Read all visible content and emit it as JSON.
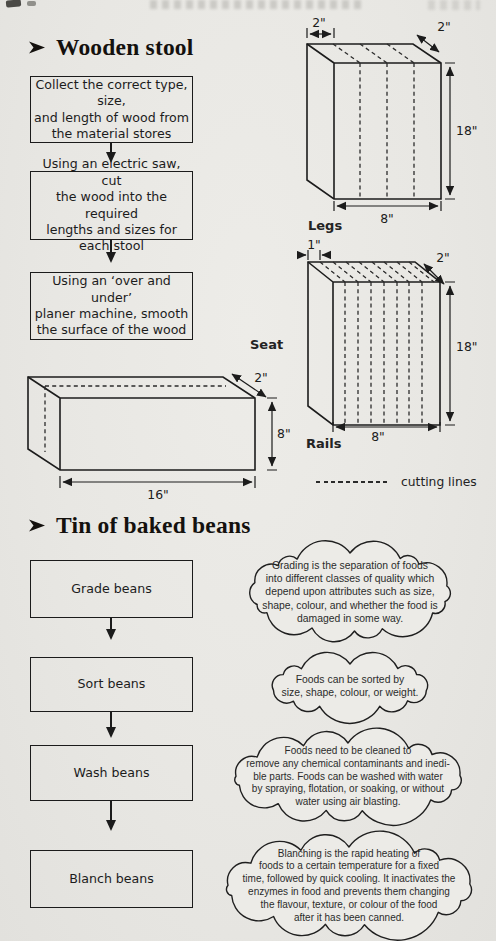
{
  "stool": {
    "heading": "Wooden stool",
    "steps": [
      "Collect the correct type, size,\nand length of wood from\nthe material stores",
      "Using an electric saw, cut\nthe wood into the required\nlengths and sizes for\neach stool",
      "Using an ‘over and under’\nplaner machine, smooth\nthe surface of the wood"
    ],
    "legs": {
      "label": "Legs",
      "dim_top": "2\"",
      "dim_depth": "2\"",
      "dim_height": "18\"",
      "dim_width": "8\""
    },
    "rails": {
      "label": "Rails",
      "dim_strip": "1\"",
      "dim_depth": "2\"",
      "dim_height": "18\"",
      "dim_width": "8\""
    },
    "seat": {
      "label": "Seat",
      "dim_depth": "2\"",
      "dim_height": "8\"",
      "dim_width": "16\""
    },
    "legend_label": "cutting lines"
  },
  "beans": {
    "heading": "Tin of baked beans",
    "steps": [
      {
        "box": "Grade beans",
        "note": "Grading is the separation of foods\ninto different classes of quality which\ndepend upon attributes such as size,\nshape, colour, and whether the food is\ndamaged in some way."
      },
      {
        "box": "Sort beans",
        "note": "Foods can be sorted by\nsize, shape, colour, or weight."
      },
      {
        "box": "Wash beans",
        "note": "Foods need to be cleaned to\nremove any chemical contaminants and inedi-\nble parts. Foods can be washed with water\nby spraying, flotation, or soaking, or without\nwater using air blasting."
      },
      {
        "box": "Blanch beans",
        "note": "Blanching is the rapid heating of\nfoods to a certain temperature for a fixed\ntime, followed by quick cooling. It inactivates the\nenzymes in food and prevents them changing\nthe flavour, texture, or colour of the food\nafter it has been canned."
      }
    ]
  }
}
